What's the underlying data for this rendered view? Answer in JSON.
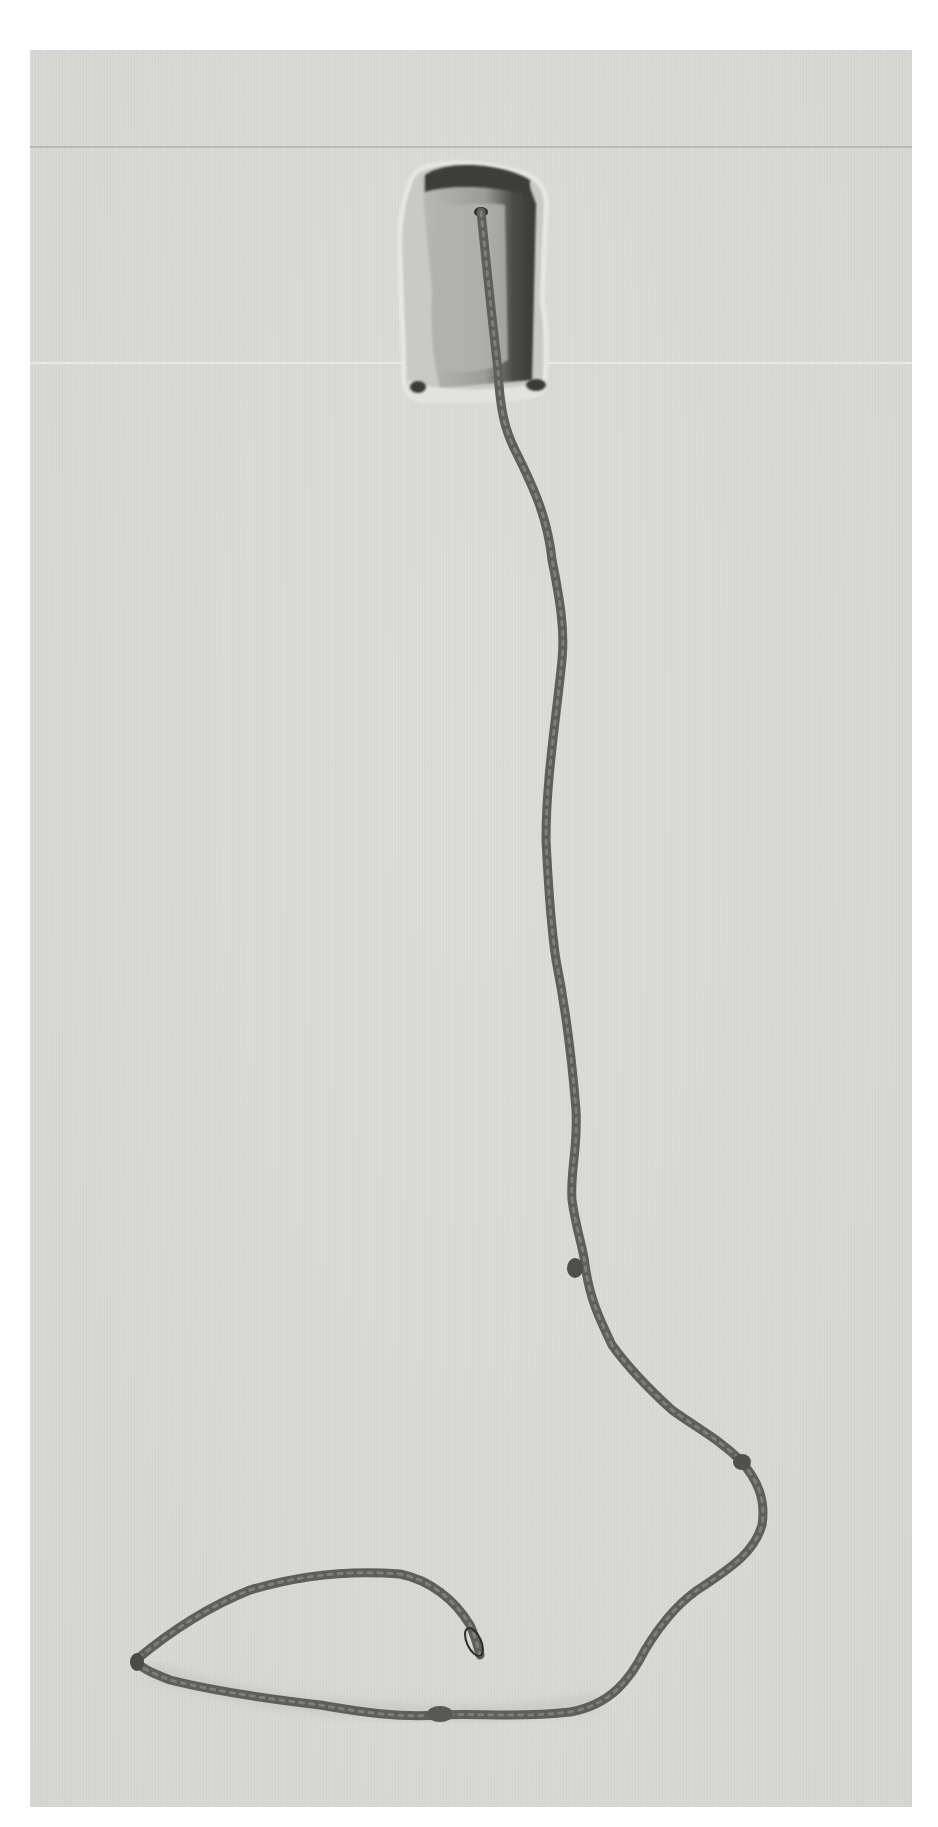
{
  "image": {
    "description": "Black-and-white photograph of a sculpture: a small open felt box mounted on a wall with a long twisted cord emerging from its interior, descending the wall and curling into a loop on the floor",
    "background_color": "#d9d9d7",
    "subject_color": "#5a5a58"
  },
  "scene": {
    "wall_box": {
      "label": "felt box",
      "position": "upper center",
      "bounds": [
        400,
        160,
        545,
        400
      ]
    },
    "cord": {
      "label": "twisted cord",
      "start": [
        505,
        210
      ],
      "end": [
        480,
        1655
      ],
      "end_detail": "small ring loop"
    },
    "floor_loop": {
      "label": "cord loop on floor",
      "tip": [
        135,
        1660
      ]
    },
    "wall_lines": [
      {
        "y": 146,
        "tone": "dark"
      },
      {
        "y": 362,
        "tone": "light"
      }
    ]
  }
}
